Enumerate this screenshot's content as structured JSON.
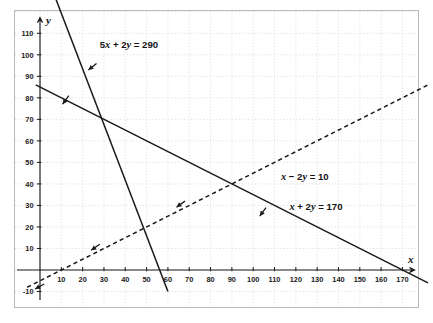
{
  "figure": {
    "frame": {
      "border_color": "#b9b9b9",
      "background": "#ffffff"
    },
    "grid": {
      "color": "#d2d2d2",
      "style": "dotted",
      "step": 10,
      "on": true
    },
    "axis_names": {
      "x": "x",
      "y": "y"
    }
  },
  "chart_data": {
    "type": "line",
    "title": "",
    "subtitle": "",
    "xlabel": "x",
    "ylabel": "y",
    "xlim": [
      -8,
      185
    ],
    "ylim": [
      -16,
      120
    ],
    "xticks": [
      10,
      20,
      30,
      40,
      50,
      60,
      70,
      80,
      90,
      100,
      110,
      120,
      130,
      140,
      150,
      160,
      170
    ],
    "yticks": [
      -10,
      10,
      20,
      30,
      40,
      50,
      60,
      70,
      80,
      90,
      100,
      110
    ],
    "xtick_labels": [
      "10",
      "20",
      "30",
      "40",
      "50",
      "60",
      "70",
      "80",
      "90",
      "100",
      "110",
      "120",
      "130",
      "140",
      "150",
      "160",
      "170"
    ],
    "ytick_labels": [
      "-10",
      "10",
      "20",
      "30",
      "40",
      "50",
      "60",
      "70",
      "80",
      "90",
      "100",
      "110"
    ],
    "grid": true,
    "legend": "none",
    "series": [
      {
        "name": "5x + 2y = 290",
        "label": "5x + 2y = 290",
        "label_parts": {
          "a": "5",
          "x": "x",
          "plus": " + ",
          "b": "2",
          "y": "y",
          "eq": " = ",
          "rhs": "290"
        },
        "style": "solid",
        "color": "#1a1a1a",
        "slope": -2.5,
        "intercept": 145,
        "x_intercept": 58,
        "y_intercept": 145,
        "points": [
          [
            2,
            140
          ],
          [
            60,
            -10
          ]
        ],
        "arrow_at": [
          22,
          90
        ],
        "arrow_direction": "down-left",
        "label_position": [
          28,
          103
        ]
      },
      {
        "name": "x + 2y = 170",
        "label": "x + 2y = 170",
        "label_parts": {
          "a": "",
          "x": "x",
          "plus": " + ",
          "b": "2",
          "y": "y",
          "eq": " = ",
          "rhs": "170"
        },
        "style": "solid",
        "color": "#1a1a1a",
        "slope": -0.5,
        "intercept": 85,
        "x_intercept": 170,
        "y_intercept": 85,
        "points": [
          [
            -2,
            86
          ],
          [
            182,
            -6
          ]
        ],
        "arrow_at": [
          18,
          76
        ],
        "arrow_direction": "down-left",
        "label_position": [
          117,
          28
        ]
      },
      {
        "name": "x - 2y = 10",
        "label": "x − 2y = 10",
        "label_parts": {
          "a": "",
          "x": "x",
          "plus": " − ",
          "b": "2",
          "y": "y",
          "eq": " = ",
          "rhs": "10"
        },
        "style": "dashed",
        "color": "#1a1a1a",
        "slope": 0.5,
        "intercept": -5,
        "x_intercept": 10,
        "y_intercept": -5,
        "points": [
          [
            -6,
            -8
          ],
          [
            182,
            86
          ]
        ],
        "arrow_at": [
          100,
          45
        ],
        "arrow_direction": "down-right-into-region",
        "label_position": [
          113,
          42
        ]
      }
    ],
    "intersections": [
      {
        "label": "",
        "x": 30,
        "y": 70
      },
      {
        "label": "",
        "x": 90,
        "y": 40
      },
      {
        "label": "",
        "x": 10,
        "y": 0
      }
    ],
    "annotations": [
      {
        "text": "5x + 2y = 290",
        "x": 28,
        "y": 103
      },
      {
        "text": "x − 2y = 10",
        "x": 113,
        "y": 42
      },
      {
        "text": "x + 2y = 170",
        "x": 117,
        "y": 28
      }
    ]
  }
}
